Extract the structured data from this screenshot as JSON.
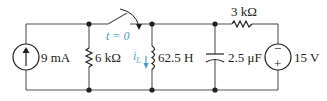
{
  "diagram": {
    "type": "circuit",
    "components": {
      "current_source": {
        "label": "9 mA",
        "direction": "up"
      },
      "resistor_1": {
        "label": "6 kΩ"
      },
      "switch": {
        "label": "t = 0",
        "action": "opens"
      },
      "inductor": {
        "label": "62.5 H",
        "current_label": "i",
        "current_sub": "L"
      },
      "capacitor": {
        "label": "2.5 μF"
      },
      "resistor_2": {
        "label": "3 kΩ"
      },
      "voltage_source": {
        "label": "15 V",
        "top_sign": "−",
        "bottom_sign": "+"
      }
    },
    "colors": {
      "wire": "#555555",
      "ink": "#231f20",
      "annotation": "#4a9fd0"
    }
  }
}
